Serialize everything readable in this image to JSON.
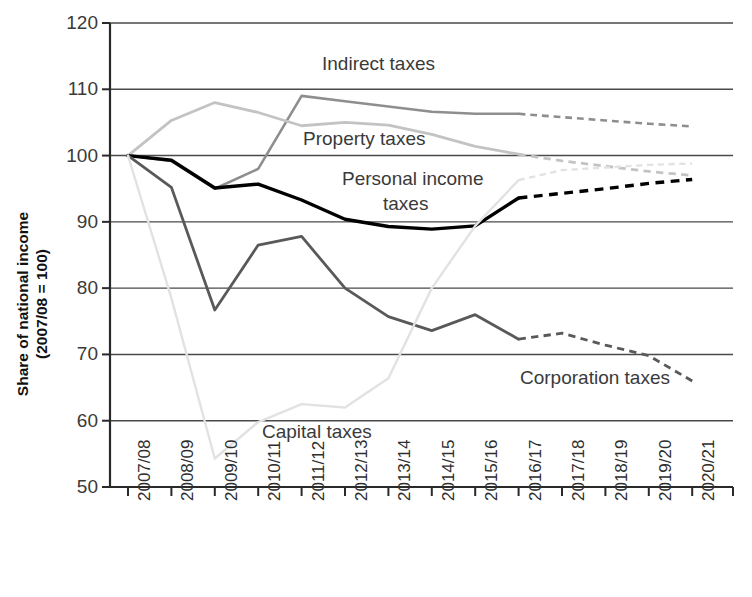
{
  "chart_data": {
    "type": "line",
    "title": "",
    "xlabel": "",
    "ylabel": "Share of national income\n(2007/08 = 100)",
    "ylabel_line1": "Share of national income",
    "ylabel_line2": "(2007/08 = 100)",
    "ylim": [
      50,
      120
    ],
    "yticks": [
      50,
      60,
      70,
      80,
      90,
      100,
      110,
      120
    ],
    "grid": true,
    "legend_position": "inline-annotations",
    "forecast_start_index": 9,
    "forecast_note": "Values from 2016/17 onwards are shown as dashed (forecast)",
    "categories": [
      "2007/08",
      "2008/09",
      "2009/10",
      "2010/11",
      "2011/12",
      "2012/13",
      "2013/14",
      "2014/15",
      "2015/16",
      "2016/17",
      "2017/18",
      "2018/19",
      "2019/20",
      "2020/21"
    ],
    "series": [
      {
        "name": "Indirect taxes",
        "color": "#8e8e8e",
        "width": 2.6,
        "values": [
          100.0,
          99.2,
          95.0,
          98.0,
          109.0,
          108.2,
          107.4,
          106.6,
          106.3,
          106.3,
          105.8,
          105.3,
          104.8,
          104.4
        ]
      },
      {
        "name": "Property taxes",
        "color": "#c3c3c3",
        "width": 2.8,
        "values": [
          100.0,
          105.3,
          108.0,
          106.5,
          104.5,
          105.0,
          104.6,
          103.2,
          101.4,
          100.2,
          99.2,
          98.4,
          97.6,
          97.0
        ]
      },
      {
        "name": "Personal income taxes",
        "color": "#000000",
        "width": 3.4,
        "values": [
          100.0,
          99.3,
          95.1,
          95.7,
          93.3,
          90.4,
          89.3,
          88.9,
          89.4,
          93.6,
          94.3,
          95.0,
          95.8,
          96.4
        ]
      },
      {
        "name": "Corporation taxes",
        "color": "#595959",
        "width": 2.8,
        "values": [
          100.0,
          95.2,
          76.7,
          86.5,
          87.8,
          80.0,
          75.7,
          73.6,
          76.0,
          72.3,
          73.2,
          71.4,
          69.8,
          66.0
        ]
      },
      {
        "name": "Capital taxes",
        "color": "#e2e2e2",
        "width": 2.4,
        "values": [
          100.0,
          78.5,
          54.3,
          59.8,
          62.5,
          62.0,
          66.4,
          80.0,
          89.4,
          96.3,
          97.8,
          98.2,
          98.6,
          98.8
        ]
      }
    ],
    "annotations": [
      {
        "label": "Indirect taxes",
        "x_px": 322,
        "y_px": 70,
        "anchor": "start",
        "font_size": 19
      },
      {
        "label": "Property taxes",
        "x_px": 303,
        "y_px": 145,
        "anchor": "start",
        "font_size": 19
      },
      {
        "label": "Personal income",
        "x_px": 342,
        "y_px": 185,
        "anchor": "start",
        "font_size": 19
      },
      {
        "label": "taxes",
        "x_px": 383,
        "y_px": 210,
        "anchor": "start",
        "font_size": 19
      },
      {
        "label": "Corporation taxes",
        "x_px": 520,
        "y_px": 384,
        "anchor": "start",
        "font_size": 19
      },
      {
        "label": "Capital taxes",
        "x_px": 262,
        "y_px": 438,
        "anchor": "start",
        "font_size": 19
      }
    ]
  }
}
